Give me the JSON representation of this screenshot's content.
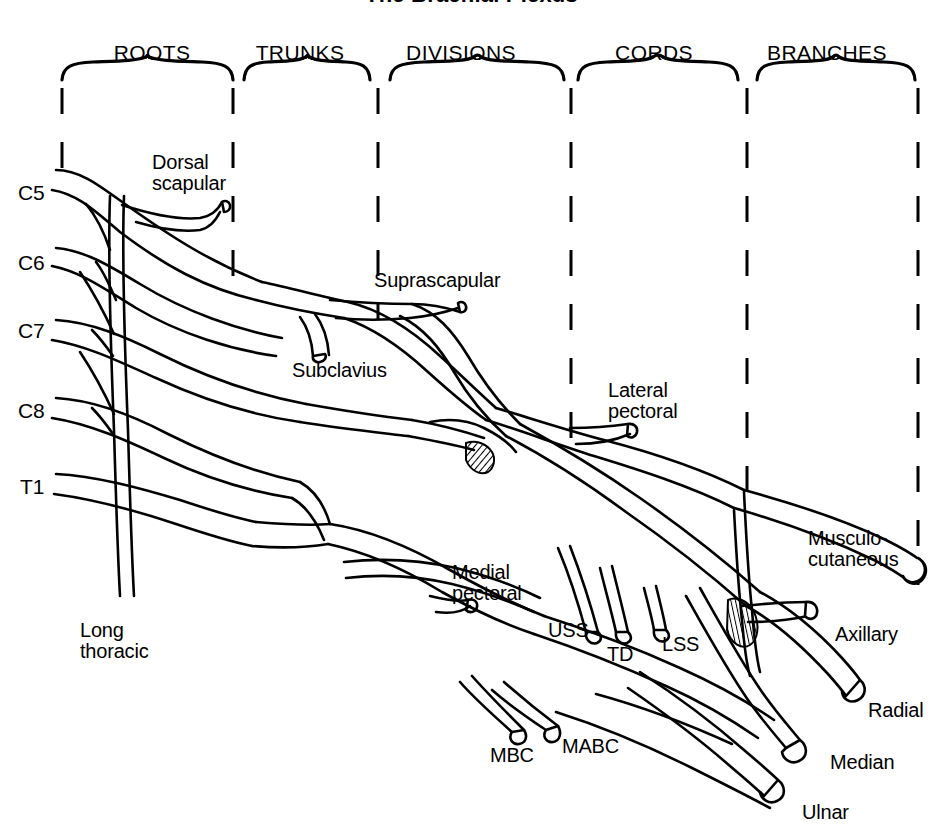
{
  "title": "The Brachial Plexus",
  "sections": [
    {
      "label": "ROOTS",
      "x": 152,
      "y": 42
    },
    {
      "label": "TRUNKS",
      "x": 300,
      "y": 42
    },
    {
      "label": "DIVISIONS",
      "x": 461,
      "y": 42
    },
    {
      "label": "CORDS",
      "x": 654,
      "y": 42
    },
    {
      "label": "BRANCHES",
      "x": 827,
      "y": 42
    }
  ],
  "roots": [
    {
      "label": "C5",
      "x": 18,
      "y": 182
    },
    {
      "label": "C6",
      "x": 18,
      "y": 252
    },
    {
      "label": "C7",
      "x": 18,
      "y": 320
    },
    {
      "label": "C8",
      "x": 18,
      "y": 400
    },
    {
      "label": "T1",
      "x": 20,
      "y": 476
    }
  ],
  "nerves": [
    {
      "id": "dorsal-scapular",
      "label": "Dorsal\nscapular",
      "x": 152,
      "y": 152
    },
    {
      "id": "suprascapular",
      "label": "Suprascapular",
      "x": 374,
      "y": 270
    },
    {
      "id": "subclavius",
      "label": "Subclavius",
      "x": 292,
      "y": 360
    },
    {
      "id": "lateral-pectoral",
      "label": "Lateral\npectoral",
      "x": 608,
      "y": 380
    },
    {
      "id": "long-thoracic",
      "label": "Long\nthoracic",
      "x": 80,
      "y": 620
    },
    {
      "id": "medial-pectoral",
      "label": "Medial\npectoral",
      "x": 452,
      "y": 562
    },
    {
      "id": "uss",
      "label": "USS",
      "x": 548,
      "y": 620
    },
    {
      "id": "td",
      "label": "TD",
      "x": 607,
      "y": 644
    },
    {
      "id": "lss",
      "label": "LSS",
      "x": 662,
      "y": 634
    },
    {
      "id": "mbc",
      "label": "MBC",
      "x": 490,
      "y": 745
    },
    {
      "id": "mabc",
      "label": "MABC",
      "x": 562,
      "y": 736
    },
    {
      "id": "musculocutaneous",
      "label": "Musculo-\ncutaneous",
      "x": 808,
      "y": 528
    },
    {
      "id": "axillary",
      "label": "Axillary",
      "x": 835,
      "y": 624
    },
    {
      "id": "radial",
      "label": "Radial",
      "x": 868,
      "y": 700
    },
    {
      "id": "median",
      "label": "Median",
      "x": 830,
      "y": 752
    },
    {
      "id": "ulnar",
      "label": "Ulnar",
      "x": 802,
      "y": 802
    }
  ],
  "colors": {
    "ink": "#000000",
    "paper": "#ffffff"
  },
  "dividers_x": [
    62,
    233,
    378,
    571,
    747,
    918
  ],
  "braces": [
    {
      "x1": 62,
      "x2": 233,
      "y": 62
    },
    {
      "x1": 244,
      "x2": 370,
      "y": 62
    },
    {
      "x1": 390,
      "x2": 564,
      "y": 62
    },
    {
      "x1": 578,
      "x2": 738,
      "y": 62
    },
    {
      "x1": 757,
      "x2": 915,
      "y": 62
    }
  ]
}
